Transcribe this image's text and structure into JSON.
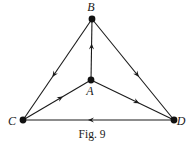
{
  "figure": {
    "caption": "Fig. 9",
    "colors": {
      "ink": "#1a1a1a",
      "background": "#ffffff"
    },
    "nodes": [
      {
        "id": "A",
        "label": "A",
        "x": 91,
        "y": 80,
        "label_x": 90,
        "label_y": 95
      },
      {
        "id": "B",
        "label": "B",
        "x": 92,
        "y": 19,
        "label_x": 91,
        "label_y": 11
      },
      {
        "id": "C",
        "label": "C",
        "x": 23,
        "y": 120,
        "label_x": 12,
        "label_y": 125
      },
      {
        "id": "D",
        "label": "D",
        "x": 174,
        "y": 120,
        "label_x": 181,
        "label_y": 125
      }
    ],
    "edges": [
      {
        "from": "B",
        "to": "C",
        "arrow_at": 0.55
      },
      {
        "from": "B",
        "to": "D",
        "arrow_at": 0.55
      },
      {
        "from": "A",
        "to": "B",
        "arrow_at": 0.55
      },
      {
        "from": "C",
        "to": "A",
        "arrow_at": 0.55
      },
      {
        "from": "A",
        "to": "D",
        "arrow_at": 0.55
      },
      {
        "from": "D",
        "to": "C",
        "arrow_at": 0.55
      }
    ]
  }
}
